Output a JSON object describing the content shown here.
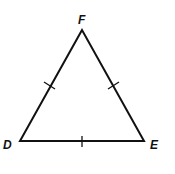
{
  "diagram": {
    "type": "equilateral-triangle",
    "stroke_color": "#111111",
    "vertices": [
      {
        "label": "F",
        "x": 82,
        "y": 30
      },
      {
        "label": "D",
        "x": 20,
        "y": 141
      },
      {
        "label": "E",
        "x": 144,
        "y": 141
      }
    ],
    "labels": {
      "F": "F",
      "D": "D",
      "E": "E"
    },
    "congruence_marks": [
      "DF",
      "FE",
      "DE"
    ]
  }
}
